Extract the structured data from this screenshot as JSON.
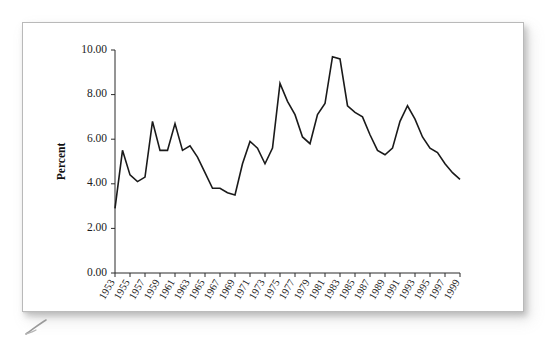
{
  "document": {
    "kind": "scanned-page-figure",
    "card_background": "#ffffff",
    "card_border_color": "#b9b9b9"
  },
  "chart_data": {
    "type": "line",
    "title": "",
    "subtitle": "",
    "xlabel": "",
    "ylabel": "Percent",
    "grid": false,
    "legend": false,
    "legend_position": "none",
    "line_color": "#1a1a1a",
    "xlim": [
      1953,
      1999
    ],
    "ylim": [
      0.0,
      10.0
    ],
    "yticks": [
      0.0,
      2.0,
      4.0,
      6.0,
      8.0,
      10.0
    ],
    "ytick_labels": [
      "0.00",
      "2.00",
      "4.00",
      "6.00",
      "8.00",
      "10.00"
    ],
    "xticks": [
      1953,
      1955,
      1957,
      1959,
      1961,
      1963,
      1965,
      1967,
      1969,
      1971,
      1973,
      1975,
      1977,
      1979,
      1981,
      1983,
      1985,
      1987,
      1989,
      1991,
      1993,
      1995,
      1997,
      1999
    ],
    "xtick_labels": [
      "1953",
      "1955",
      "1957",
      "1959",
      "1961",
      "1963",
      "1965",
      "1967",
      "1969",
      "1971",
      "1973",
      "1975",
      "1977",
      "1979",
      "1981",
      "1983",
      "1985",
      "1987",
      "1989",
      "1991",
      "1993",
      "1995",
      "1997",
      "1999"
    ],
    "x": [
      1953,
      1954,
      1955,
      1956,
      1957,
      1958,
      1959,
      1960,
      1961,
      1962,
      1963,
      1964,
      1965,
      1966,
      1967,
      1968,
      1969,
      1970,
      1971,
      1972,
      1973,
      1974,
      1975,
      1976,
      1977,
      1978,
      1979,
      1980,
      1981,
      1982,
      1983,
      1984,
      1985,
      1986,
      1987,
      1988,
      1989,
      1990,
      1991,
      1992,
      1993,
      1994,
      1995,
      1996,
      1997,
      1998,
      1999
    ],
    "values": [
      2.9,
      5.5,
      4.4,
      4.1,
      4.3,
      6.8,
      5.5,
      5.5,
      6.7,
      5.5,
      5.7,
      5.2,
      4.5,
      3.8,
      3.8,
      3.6,
      3.5,
      4.9,
      5.9,
      5.6,
      4.9,
      5.6,
      8.5,
      7.7,
      7.1,
      6.1,
      5.8,
      7.1,
      7.6,
      9.7,
      9.6,
      7.5,
      7.2,
      7.0,
      6.2,
      5.5,
      5.3,
      5.6,
      6.8,
      7.5,
      6.9,
      6.1,
      5.6,
      5.4,
      4.9,
      4.5,
      4.2
    ],
    "annotations": []
  },
  "chart_geometry": {
    "plot_left_px": 92,
    "plot_right_px": 437,
    "plot_top_px": 27,
    "plot_bottom_px": 250
  }
}
